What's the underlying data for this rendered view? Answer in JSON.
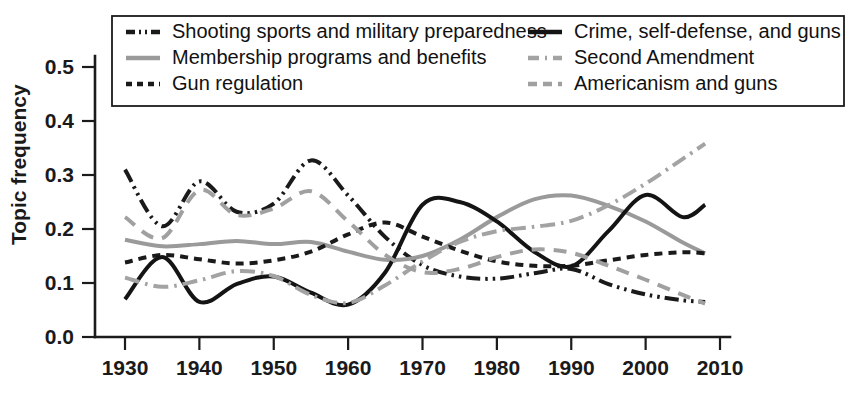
{
  "chart_data": {
    "type": "line",
    "title": "",
    "xlabel": "",
    "ylabel": "Topic frequency",
    "xlim": [
      1930,
      2010
    ],
    "ylim": [
      0.0,
      0.5
    ],
    "grid": false,
    "legend_position": "top-inside",
    "xticks": [
      "1930",
      "1940",
      "1950",
      "1960",
      "1970",
      "1980",
      "1990",
      "2000",
      "2010"
    ],
    "xtick_values": [
      1930,
      1940,
      1950,
      1960,
      1970,
      1980,
      1990,
      2000,
      2010
    ],
    "yticks": [
      "0.0",
      "0.1",
      "0.2",
      "0.3",
      "0.4",
      "0.5"
    ],
    "ytick_values": [
      0.0,
      0.1,
      0.2,
      0.3,
      0.4,
      0.5
    ],
    "x": [
      1930,
      1935,
      1940,
      1945,
      1950,
      1955,
      1960,
      1965,
      1970,
      1975,
      1980,
      1985,
      1990,
      1995,
      2000,
      2005,
      2008
    ],
    "series": [
      {
        "name": "Shooting sports and military preparedness",
        "style": "dash-dot-dot",
        "color": "#1a1a1a",
        "values": [
          0.31,
          0.205,
          0.288,
          0.232,
          0.247,
          0.327,
          0.262,
          0.185,
          0.133,
          0.112,
          0.108,
          0.118,
          0.126,
          0.098,
          0.079,
          0.068,
          0.065
        ]
      },
      {
        "name": "Membership programs and benefits",
        "style": "solid",
        "color": "#9a9a9a",
        "values": [
          0.18,
          0.168,
          0.172,
          0.178,
          0.172,
          0.176,
          0.158,
          0.143,
          0.15,
          0.18,
          0.222,
          0.255,
          0.262,
          0.243,
          0.214,
          0.175,
          0.155
        ]
      },
      {
        "name": "Gun regulation",
        "style": "dashed-fine",
        "color": "#1a1a1a",
        "values": [
          0.138,
          0.152,
          0.144,
          0.136,
          0.142,
          0.158,
          0.19,
          0.212,
          0.186,
          0.16,
          0.14,
          0.132,
          0.132,
          0.142,
          0.152,
          0.157,
          0.155
        ]
      },
      {
        "name": "Crime, self-defense, and guns",
        "style": "solid",
        "color": "#141414",
        "values": [
          0.07,
          0.148,
          0.065,
          0.098,
          0.112,
          0.082,
          0.06,
          0.12,
          0.245,
          0.25,
          0.214,
          0.158,
          0.131,
          0.196,
          0.263,
          0.222,
          0.245
        ]
      },
      {
        "name": "Second Amendment",
        "style": "dash-dot",
        "color": "#a3a3a3",
        "values": [
          0.11,
          0.093,
          0.105,
          0.122,
          0.113,
          0.078,
          0.063,
          0.096,
          0.14,
          0.176,
          0.196,
          0.204,
          0.215,
          0.244,
          0.284,
          0.33,
          0.358
        ]
      },
      {
        "name": "Americanism and guns",
        "style": "dashed",
        "color": "#a0a0a0",
        "values": [
          0.222,
          0.183,
          0.272,
          0.226,
          0.238,
          0.27,
          0.214,
          0.152,
          0.12,
          0.126,
          0.148,
          0.162,
          0.156,
          0.132,
          0.106,
          0.078,
          0.062
        ]
      }
    ]
  },
  "legend": {
    "column_left": [
      {
        "label": "Shooting sports and military preparedness",
        "series_index": 0
      },
      {
        "label": "Membership programs and benefits",
        "series_index": 1
      },
      {
        "label": "Gun regulation",
        "series_index": 2
      }
    ],
    "column_right": [
      {
        "label": "Crime, self-defense, and guns",
        "series_index": 3
      },
      {
        "label": "Second Amendment",
        "series_index": 4
      },
      {
        "label": "Americanism and guns",
        "series_index": 5
      }
    ]
  },
  "colors": {
    "dark": "#1a1a1a",
    "light_gray": "#9e9e9e",
    "background": "#ffffff"
  }
}
